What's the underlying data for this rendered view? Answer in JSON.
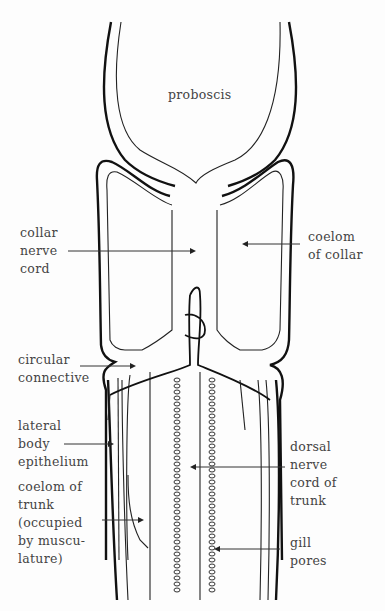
{
  "figure": {
    "labels": {
      "proboscis": "proboscis",
      "collar_nerve_cord": "collar\nnerve\ncord",
      "coelom_of_collar": "coelom\nof collar",
      "circular_connective": "circular\nconnective",
      "lateral_body_epithelium": "lateral\nbody\nepithelium",
      "coelom_of_trunk": "coelom of\ntrunk\n(occupied\nby muscu-\nlature)",
      "dorsal_nerve_cord_of_trunk": "dorsal\nnerve\ncord of\ntrunk",
      "gill_pores": "gill\npores"
    },
    "colors": {
      "line": "#111111",
      "text": "#444444",
      "background": "#fdfdfd"
    }
  }
}
